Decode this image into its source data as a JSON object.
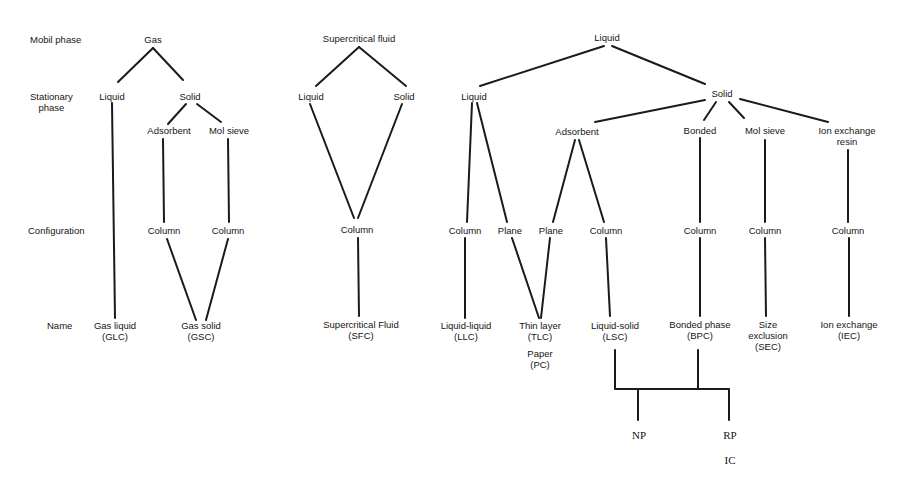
{
  "diagram": {
    "row_labels": {
      "mobile_phase": "Mobil phase",
      "stationary_phase_1": "Stationary",
      "stationary_phase_2": "phase",
      "configuration": "Configuration",
      "name": "Name"
    },
    "gas_tree": {
      "mobile": "Gas",
      "stationary_liquid": "Liquid",
      "stationary_solid": "Solid",
      "adsorbent": "Adsorbent",
      "mol_sieve": "Mol sieve",
      "config_column_1": "Column",
      "config_column_2": "Column",
      "name_glc_1": "Gas liquid",
      "name_glc_2": "(GLC)",
      "name_gsc_1": "Gas solid",
      "name_gsc_2": "(GSC)"
    },
    "sfc_tree": {
      "mobile": "Supercritical fluid",
      "stationary_liquid": "Liquid",
      "stationary_solid": "Solid",
      "config_column": "Column",
      "name_1": "Supercritical Fluid",
      "name_2": "(SFC)"
    },
    "liquid_tree": {
      "mobile": "Liquid",
      "stationary_liquid": "Liquid",
      "stationary_solid": "Solid",
      "adsorbent": "Adsorbent",
      "bonded": "Bonded",
      "mol_sieve": "Mol sieve",
      "ion_exchange_1": "Ion exchange",
      "ion_exchange_2": "resin",
      "config_column_llc": "Column",
      "config_plane_1": "Plane",
      "config_plane_2": "Plane",
      "config_column_lsc": "Column",
      "config_column_bpc": "Column",
      "config_column_sec": "Column",
      "config_column_iec": "Column",
      "name_llc_1": "Liquid-liquid",
      "name_llc_2": "(LLC)",
      "name_tlc_1": "Thin layer",
      "name_tlc_2": "(TLC)",
      "name_pc_1": "Paper",
      "name_pc_2": "(PC)",
      "name_lsc_1": "Liquid-solid",
      "name_lsc_2": "(LSC)",
      "name_bpc_1": "Bonded phase",
      "name_bpc_2": "(BPC)",
      "name_sec_1": "Size",
      "name_sec_2": "exclusion",
      "name_sec_3": "(SEC)",
      "name_iec_1": "Ion exchange",
      "name_iec_2": "(IEC)"
    },
    "modes": {
      "np": "NP",
      "rp": "RP",
      "ic": "IC"
    }
  }
}
